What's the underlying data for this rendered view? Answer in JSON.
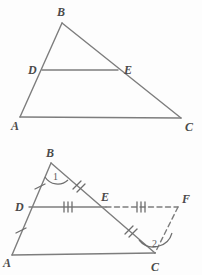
{
  "page": {
    "background_color": "#fdfdfd",
    "line_color": "#7d7d7d",
    "label_color": "#4a4a4a",
    "width": 202,
    "height": 275
  },
  "figures": [
    {
      "id": "triangle-abc",
      "caption": "",
      "description": "Triangle ABC with midsegment DE parallel to AC",
      "vertices": [
        {
          "name": "A",
          "label": "A",
          "x": 20,
          "y": 117,
          "label_x": 11,
          "label_y": 127
        },
        {
          "name": "B",
          "label": "B",
          "x": 62,
          "y": 23,
          "label_x": 57,
          "label_y": 14
        },
        {
          "name": "C",
          "label": "C",
          "x": 181,
          "y": 118,
          "label_x": 186,
          "label_y": 129
        },
        {
          "name": "D",
          "label": "D",
          "x": 42,
          "y": 70,
          "label_x": 30,
          "label_y": 73
        },
        {
          "name": "E",
          "label": "E",
          "x": 118,
          "y": 70,
          "label_x": 124,
          "label_y": 73
        }
      ],
      "segments": [
        {
          "name": "AB",
          "from": "A",
          "to": "B",
          "style": "solid"
        },
        {
          "name": "BC",
          "from": "B",
          "to": "C",
          "style": "solid"
        },
        {
          "name": "AC",
          "from": "A",
          "to": "C",
          "style": "solid"
        },
        {
          "name": "DE",
          "from": "D",
          "to": "E",
          "style": "solid"
        }
      ],
      "tick_marks": [],
      "angle_marks": []
    },
    {
      "id": "triangle-abc-extended",
      "caption": "",
      "description": "Triangle ABC with midsegment DE extended through E to point F, with congruence tick marks and angles 1 and 2",
      "vertices": [
        {
          "name": "A",
          "label": "A",
          "x": 12,
          "y": 255,
          "label_x": 4,
          "label_y": 264
        },
        {
          "name": "B",
          "label": "B",
          "x": 51,
          "y": 163,
          "label_x": 46,
          "label_y": 155
        },
        {
          "name": "C",
          "label": "C",
          "x": 155,
          "y": 253,
          "label_x": 152,
          "label_y": 268
        },
        {
          "name": "D",
          "label": "D",
          "x": 29,
          "y": 207,
          "label_x": 17,
          "label_y": 211
        },
        {
          "name": "E",
          "label": "E",
          "x": 106,
          "y": 207,
          "label_x": 104,
          "label_y": 200
        },
        {
          "name": "F",
          "label": "F",
          "x": 178,
          "y": 207,
          "label_x": 183,
          "label_y": 202
        }
      ],
      "segments": [
        {
          "name": "AB",
          "from": "A",
          "to": "B",
          "style": "solid"
        },
        {
          "name": "BC",
          "from": "B",
          "to": "C",
          "style": "solid"
        },
        {
          "name": "AC",
          "from": "A",
          "to": "C",
          "style": "solid"
        },
        {
          "name": "DE",
          "from": "D",
          "to": "E",
          "style": "solid"
        },
        {
          "name": "EF",
          "from": "E",
          "to": "F",
          "style": "dashed"
        },
        {
          "name": "FC",
          "from": "F",
          "to": "C",
          "style": "dashed"
        }
      ],
      "tick_marks": [
        {
          "name": "tick-DB",
          "segment": "DB",
          "count": 1,
          "x": 40,
          "y": 185
        },
        {
          "name": "tick-DA",
          "segment": "DA",
          "count": 1,
          "x": 21,
          "y": 231
        },
        {
          "name": "tick-BE",
          "segment": "BE",
          "count": 2,
          "x": 78,
          "y": 185
        },
        {
          "name": "tick-EC",
          "segment": "EC",
          "count": 2,
          "x": 130,
          "y": 230
        },
        {
          "name": "tick-DE",
          "segment": "DE",
          "count": 3,
          "x": 68,
          "y": 207
        },
        {
          "name": "tick-EF",
          "segment": "EF",
          "count": 3,
          "x": 141,
          "y": 207
        }
      ],
      "angle_marks": [
        {
          "name": "angle-1",
          "label": "1",
          "vertex": "B",
          "label_x": 56,
          "label_y": 176
        },
        {
          "name": "angle-2",
          "label": "2",
          "vertex": "C",
          "label_x": 156,
          "label_y": 243
        }
      ]
    }
  ]
}
